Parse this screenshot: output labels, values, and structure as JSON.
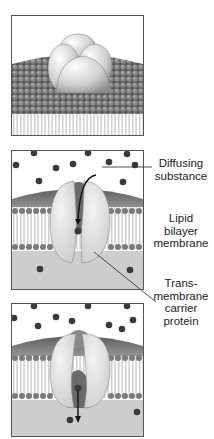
{
  "figure": {
    "panels": [
      {
        "id": "panel-1",
        "description": "Carrier protein embedded in lipid bilayer (surface view)"
      },
      {
        "id": "panel-2",
        "description": "Diffusing substance enters carrier protein channel"
      },
      {
        "id": "panel-3",
        "description": "Carrier protein releases substance to other side"
      }
    ],
    "labels": {
      "diffusing_substance_1": "Diffusing",
      "diffusing_substance_2": "substance",
      "lipid_1": "Lipid",
      "lipid_2": "bilayer",
      "lipid_3": "membrane",
      "carrier_1": "Trans-",
      "carrier_2": "membrane",
      "carrier_3": "carrier",
      "carrier_4": "protein"
    },
    "colors": {
      "membrane_head": "#6e6e6e",
      "protein": "#e6e6e6",
      "molecule": "#3a3a3a",
      "background_inside": "#cfcfcf",
      "border": "#555555"
    }
  }
}
